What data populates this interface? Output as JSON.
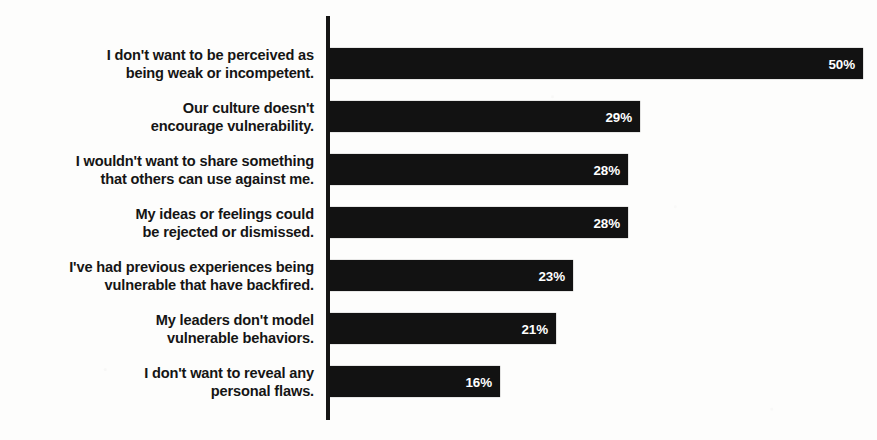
{
  "chart_data": {
    "type": "bar",
    "orientation": "horizontal",
    "title": "",
    "subtitle": "",
    "xlabel": "",
    "ylabel": "",
    "grid": false,
    "legend": false,
    "legend_position": "none",
    "axis_line": "vertical category axis at left of bars",
    "value_suffix": "%",
    "xlim": [
      0,
      50
    ],
    "categories": [
      "I don't want to be perceived as\nbeing weak or incompetent.",
      "Our culture doesn't\nencourage vulnerability.",
      "I wouldn't want to share something\nthat others can use against me.",
      "My ideas or feelings could\nbe rejected or dismissed.",
      "I've had previous experiences being\nvulnerable that have backfired.",
      "My leaders don't model\nvulnerable behaviors.",
      "I don't want to reveal any\npersonal flaws."
    ],
    "values": [
      50,
      29,
      28,
      28,
      23,
      21,
      16
    ],
    "value_labels": [
      "50%",
      "29%",
      "28%",
      "28%",
      "23%",
      "21%",
      "16%"
    ],
    "bar_pixel_lengths": [
      533,
      310,
      298,
      298,
      243,
      226,
      170
    ],
    "colors": {
      "bar": "#121212",
      "background": "#fdfdfc",
      "axis": "#151515",
      "category_label": "#151515",
      "value_label": "#ffffff"
    }
  }
}
